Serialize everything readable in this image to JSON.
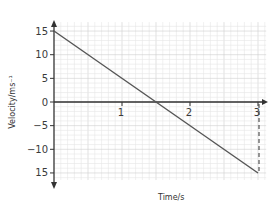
{
  "chart_data": {
    "type": "line",
    "title": "",
    "xlabel": "Time/s",
    "ylabel": "Velocity/ms⁻¹",
    "xlim": [
      0,
      3.1
    ],
    "ylim": [
      -16.5,
      17
    ],
    "grid": true,
    "x_ticks": [
      1,
      2,
      3
    ],
    "x_tick_labels": [
      "1",
      "2",
      "3"
    ],
    "y_ticks": [
      15,
      10,
      5,
      0,
      -5,
      -10,
      -15
    ],
    "y_tick_labels": [
      "15",
      "10",
      "5",
      "0",
      "−5",
      "−10",
      "15"
    ],
    "series": [
      {
        "name": "velocity",
        "x": [
          0,
          1.5,
          3
        ],
        "y": [
          15,
          0,
          -15
        ],
        "style": "solid",
        "color": "#555555"
      }
    ],
    "annotations": [
      {
        "type": "dashed-vertical",
        "x": 3,
        "y_from": 0,
        "y_to": -15,
        "color": "#333333"
      }
    ],
    "legend": null
  },
  "colors": {
    "axis": "#333333",
    "line": "#555555",
    "grid_minor": "#e6e6e6",
    "grid_major": "#cfcfcf"
  }
}
